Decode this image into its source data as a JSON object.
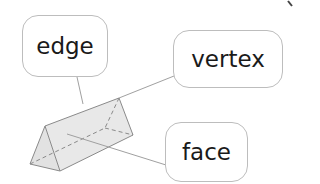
{
  "diagram": {
    "labels": [
      {
        "id": "edge",
        "text": "edge"
      },
      {
        "id": "vertex",
        "text": "vertex"
      },
      {
        "id": "face",
        "text": "face"
      }
    ]
  },
  "colors": {
    "box_border": "#bdbdbd",
    "text": "#1a1a1a",
    "prism_fill": "#e6e6e6",
    "prism_stroke": "#8a8a8a",
    "leader_line": "#a0a0a0"
  }
}
